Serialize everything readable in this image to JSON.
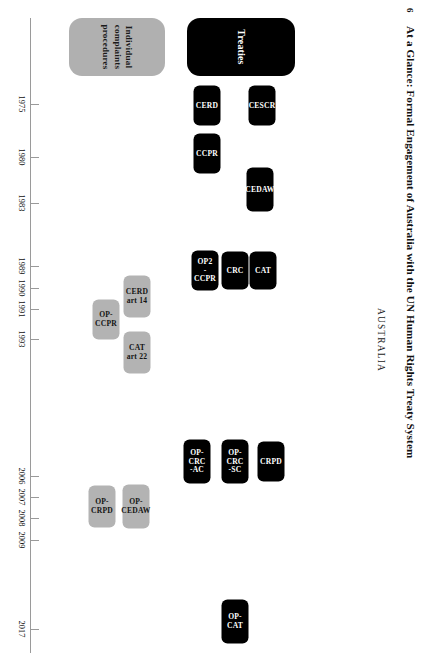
{
  "figure": {
    "number": "6",
    "title": "At a Glance: Formal Engagement of Australia with the UN Human Rights Treaty System",
    "country": "AUSTRALIA"
  },
  "colors": {
    "treaties_fill": "#000000",
    "treaties_text": "#ffffff",
    "complaints_fill": "#b3b3b3",
    "complaints_text": "#141414",
    "axis": "#9a9a9a",
    "background": "#ffffff"
  },
  "categories": [
    {
      "id": "treaties",
      "label": "Treaties",
      "style": "black"
    },
    {
      "id": "complaints",
      "label": "Individual\ncomplaints\nprocedures",
      "style": "grey"
    }
  ],
  "chart_data": {
    "type": "timeline",
    "title": "At a Glance: Formal Engagement of Australia with the UN Human Rights Treaty System",
    "subject": "AUSTRALIA",
    "xlabel": "",
    "ylabel": "",
    "axis_years": [
      1975,
      1980,
      1983,
      1989,
      1990,
      1991,
      1993,
      2006,
      2007,
      2008,
      2009,
      2017
    ],
    "xlim": [
      1972,
      2019
    ],
    "grid": false,
    "legend": [
      "Treaties",
      "Individual complaints procedures"
    ],
    "series": [
      {
        "name": "Treaties",
        "style": "black",
        "points": [
          {
            "label": "CESCR",
            "year": 1975
          },
          {
            "label": "CERD",
            "year": 1975
          },
          {
            "label": "CCPR",
            "year": 1980
          },
          {
            "label": "CEDAW",
            "year": 1983
          },
          {
            "label": "CAT",
            "year": 1989
          },
          {
            "label": "CRC",
            "year": 1990
          },
          {
            "label": "OP2\n-CCPR",
            "year": 1991
          },
          {
            "label": "CRPD",
            "year": 2008
          },
          {
            "label": "OP-CRC\n-SC",
            "year": 2007
          },
          {
            "label": "OP-CRC\n-AC",
            "year": 2006
          },
          {
            "label": "OP-CAT",
            "year": 2017
          }
        ]
      },
      {
        "name": "Individual complaints procedures",
        "style": "grey",
        "points": [
          {
            "label": "CERD\nart 14",
            "year": 1993
          },
          {
            "label": "OP-\nCCPR",
            "year": 1991
          },
          {
            "label": "CAT\nart 22",
            "year": 1993
          },
          {
            "label": "OP-\nCEDAW",
            "year": 2008
          },
          {
            "label": "OP-\nCRPD",
            "year": 2009
          }
        ]
      }
    ]
  },
  "layout": {
    "treaty_items": [
      {
        "key": "cesscr",
        "label": "CESCR",
        "left": 92,
        "top": 141,
        "w": 27,
        "h": 40
      },
      {
        "key": "cerd",
        "label": "CERD",
        "left": 92,
        "top": 196,
        "w": 27,
        "h": 40
      },
      {
        "key": "ccpr",
        "label": "CCPR",
        "left": 140,
        "top": 196,
        "w": 27,
        "h": 40
      },
      {
        "key": "cedaw",
        "label": "CEDAW",
        "left": 176,
        "top": 141,
        "w": 27,
        "h": 44
      },
      {
        "key": "cat",
        "label": "CAT",
        "left": 257,
        "top": 141,
        "w": 27,
        "h": 38
      },
      {
        "key": "crc",
        "label": "CRC",
        "left": 257,
        "top": 169,
        "w": 27,
        "h": 38
      },
      {
        "key": "op2ccpr",
        "label": "OP2\n-CCPR",
        "left": 257,
        "top": 198,
        "w": 27,
        "h": 40
      },
      {
        "key": "crpd",
        "label": "CRPD",
        "left": 448,
        "top": 132,
        "w": 27,
        "h": 40
      },
      {
        "key": "opcrcsc",
        "label": "OP-CRC\n-SC",
        "left": 448,
        "top": 166,
        "w": 27,
        "h": 44
      },
      {
        "key": "opcrcac",
        "label": "OP-CRC\n-AC",
        "left": 448,
        "top": 204,
        "w": 27,
        "h": 44
      },
      {
        "key": "opcat",
        "label": "OP-CAT",
        "left": 608,
        "top": 166,
        "w": 27,
        "h": 44
      }
    ],
    "complaint_items": [
      {
        "key": "cerdart14",
        "label": "CERD\nart 14",
        "left": 283,
        "top": 265,
        "w": 27,
        "h": 42
      },
      {
        "key": "opccpr",
        "label": "OP-\nCCPR",
        "left": 306,
        "top": 297,
        "w": 27,
        "h": 40
      },
      {
        "key": "catart22",
        "label": "CAT\nart 22",
        "left": 339,
        "top": 265,
        "w": 27,
        "h": 42
      },
      {
        "key": "opcedaw",
        "label": "OP-\nCEDAW",
        "left": 493,
        "top": 265,
        "w": 27,
        "h": 44
      },
      {
        "key": "opcrpd",
        "label": "OP-\nCRPD",
        "left": 493,
        "top": 300,
        "w": 27,
        "h": 42
      }
    ],
    "year_ticks": [
      {
        "year": "1975",
        "x": 104
      },
      {
        "year": "1980",
        "x": 157
      },
      {
        "year": "1983",
        "x": 203
      },
      {
        "year": "1989",
        "x": 266
      },
      {
        "year": "1990",
        "x": 288
      },
      {
        "year": "1991",
        "x": 309
      },
      {
        "year": "1993",
        "x": 339
      },
      {
        "year": "2006",
        "x": 476
      },
      {
        "year": "2007",
        "x": 497
      },
      {
        "year": "2008",
        "x": 518
      },
      {
        "year": "2009",
        "x": 540
      },
      {
        "year": "2017",
        "x": 629
      }
    ]
  }
}
